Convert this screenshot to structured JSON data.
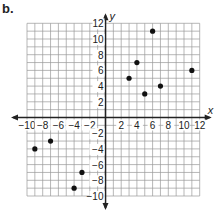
{
  "part_label": "b.",
  "chart_data": {
    "type": "scatter",
    "title": "",
    "xlabel": "x",
    "ylabel": "y",
    "xlim": [
      -10,
      12
    ],
    "ylim": [
      -10,
      12
    ],
    "grid": true,
    "x_ticks": [
      -10,
      -8,
      -6,
      -4,
      -2,
      2,
      4,
      6,
      8,
      10,
      12
    ],
    "y_ticks": [
      -10,
      -8,
      -6,
      -4,
      -2,
      2,
      4,
      6,
      8,
      10,
      12
    ],
    "points": [
      {
        "x": 3,
        "y": 5
      },
      {
        "x": 4,
        "y": 7
      },
      {
        "x": 5,
        "y": 3
      },
      {
        "x": 6,
        "y": 11
      },
      {
        "x": 7,
        "y": 4
      },
      {
        "x": 11,
        "y": 6
      },
      {
        "x": -9,
        "y": -4
      },
      {
        "x": -7,
        "y": -3
      },
      {
        "x": -4,
        "y": -9
      },
      {
        "x": -3,
        "y": -7
      }
    ],
    "point_color": "#111111",
    "grid_color": "#999999",
    "axis_color": "#222222"
  }
}
